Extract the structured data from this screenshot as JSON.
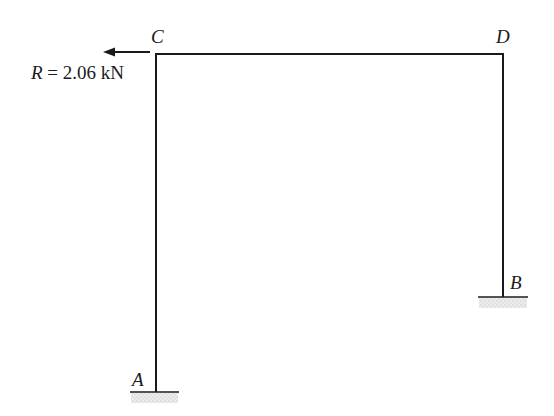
{
  "diagram": {
    "type": "portal frame",
    "nodes": [
      {
        "id": "A",
        "label": "A",
        "support": "fixed",
        "x": 156,
        "y": 392
      },
      {
        "id": "B",
        "label": "B",
        "support": "fixed",
        "x": 503,
        "y": 297
      },
      {
        "id": "C",
        "label": "C",
        "x": 156,
        "y": 54
      },
      {
        "id": "D",
        "label": "D",
        "x": 503,
        "y": 54
      }
    ],
    "members": [
      {
        "from": "A",
        "to": "C"
      },
      {
        "from": "C",
        "to": "D"
      },
      {
        "from": "D",
        "to": "B"
      }
    ],
    "loads": [
      {
        "at": "C",
        "direction": "left",
        "symbol": "R",
        "equals": "=",
        "value": "2.06",
        "unit": "kN",
        "text": "R = 2.06 kN"
      }
    ]
  },
  "labels": {
    "A": "A",
    "B": "B",
    "C": "C",
    "D": "D",
    "load_symbol": "R",
    "load_rest": " = 2.06 kN"
  },
  "colors": {
    "line": "#1a1a1a",
    "ground_hatch": "#d6d6d6"
  }
}
